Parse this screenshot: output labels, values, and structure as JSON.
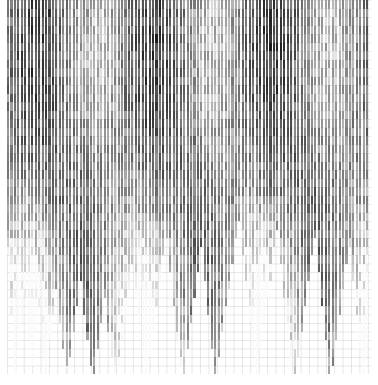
{
  "figure": {
    "title": "",
    "background_color": "#ffffff",
    "grid_color": "#aaaab4",
    "margins": {
      "left": 7,
      "top": 0,
      "right": 7,
      "bottom": 11
    }
  },
  "chart_data": {
    "type": "bar",
    "orientation": "vertical-hanging",
    "title": "",
    "subtitle": "",
    "xlabel": "",
    "ylabel": "",
    "categories": [],
    "x_tick_labels": [],
    "y_tick_labels": [],
    "legend": [],
    "annotations": [],
    "grid": true,
    "legend_position": "none",
    "colormap": "grayscale",
    "value_range": [
      0,
      1
    ],
    "n_bars": 105,
    "n_segments": 44,
    "bar_pitch_px": 3.466,
    "bar_width_px": 2.1,
    "segment_height_px": 8.5,
    "lengths": [
      30,
      37,
      44,
      41,
      38,
      35,
      40,
      43,
      39,
      36,
      42,
      44,
      40,
      37,
      34,
      38,
      41,
      44,
      42,
      39,
      36,
      33,
      37,
      40,
      43,
      44,
      41,
      38,
      35,
      39,
      42,
      44,
      43,
      40,
      37,
      34,
      31,
      35,
      38,
      41,
      44,
      42,
      39,
      36,
      33,
      30,
      28,
      32,
      36,
      40,
      43,
      44,
      41,
      38,
      35,
      32,
      29,
      33,
      37,
      41,
      44,
      42,
      39,
      36,
      34,
      31,
      28,
      26,
      30,
      34,
      38,
      42,
      44,
      41,
      38,
      35,
      33,
      30,
      27,
      31,
      35,
      39,
      43,
      44,
      42,
      39,
      36,
      33,
      30,
      28,
      32,
      36,
      40,
      44,
      43,
      40,
      37,
      34,
      31,
      29,
      33,
      37,
      41,
      44,
      42
    ]
  },
  "accessibility": {
    "alt": "Grayscale dense vertical bar chart with segmented bars over a faint grid"
  }
}
